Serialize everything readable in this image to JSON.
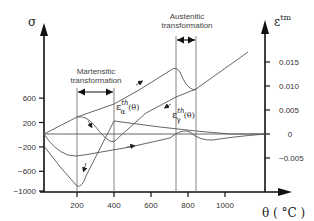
{
  "chart_data": {
    "type": "line",
    "title": "",
    "xlabel": "θ ( °C )",
    "ylabel_left": "σ",
    "ylabel_right": "ε^tm",
    "xlim": [
      0,
      1200
    ],
    "ylim_left": [
      -1000,
      1600
    ],
    "ylim_right": [
      -0.008,
      0.022
    ],
    "x_ticks": [
      200,
      400,
      600,
      800,
      1000
    ],
    "y_left_ticks": [
      600,
      200,
      -200,
      -600,
      -1000
    ],
    "y_right_ticks": [
      0.015,
      0.01,
      0.005,
      0,
      -0.005
    ],
    "y_right_tick_labels": [
      "0.015",
      "0.010",
      "0.005",
      "0",
      "-0.005"
    ],
    "grid": false,
    "annotations": [
      {
        "text": [
          "Martensitic",
          "transformation"
        ],
        "range_x": [
          200,
          400
        ]
      },
      {
        "text": [
          "Austenitic",
          "transformation"
        ],
        "range_x": [
          740,
          850
        ]
      },
      {
        "text": "ε_α^th(θ)",
        "near_x": 400
      },
      {
        "text": "ε_γ^th(θ)",
        "near_x": 760
      }
    ],
    "series": [
      {
        "name": "thermal strain heating/cooling loop (ε^tm)",
        "axis": "right",
        "x": [
          0,
          200,
          400,
          740,
          780,
          850,
          1150
        ],
        "y": [
          0.0,
          0.0035,
          0.0085,
          0.0145,
          0.012,
          0.0095,
          0.019
        ]
      },
      {
        "name": "ε_α^th(θ) cooling branch (ε^tm)",
        "axis": "right",
        "x": [
          200,
          290,
          400,
          600,
          750,
          850
        ],
        "y": [
          0.0035,
          0.0005,
          -0.002,
          0.002,
          0.0065,
          0.0095
        ]
      },
      {
        "name": "σ residual stress curve A",
        "axis": "left",
        "x": [
          0,
          100,
          200,
          280,
          400,
          600,
          800,
          1000,
          1150
        ],
        "y": [
          -200,
          -700,
          -920,
          -500,
          230,
          170,
          100,
          40,
          0
        ]
      },
      {
        "name": "σ residual stress curve B",
        "axis": "left",
        "x": [
          0,
          120,
          300,
          500,
          700,
          780,
          850,
          950,
          1150
        ],
        "y": [
          0,
          -330,
          -320,
          -260,
          -120,
          70,
          -40,
          -80,
          0
        ]
      },
      {
        "name": "zero reference",
        "axis": "left",
        "x": [
          0,
          1150
        ],
        "y": [
          0,
          0
        ]
      }
    ]
  },
  "labels": {
    "sigma": "σ",
    "epsilon_tm": "ε",
    "epsilon_tm_sup": "tm",
    "theta_axis": "θ ( °C )",
    "martensitic_1": "Martensitic",
    "martensitic_2": "transformation",
    "austenitic_1": "Austenitic",
    "austenitic_2": "transformation",
    "eps_alpha_base": "ε",
    "eps_alpha_sub": "α",
    "eps_alpha_sup": "th",
    "eps_alpha_arg": "(θ)",
    "eps_gamma_base": "ε",
    "eps_gamma_sub": "γ",
    "eps_gamma_sup": "th",
    "eps_gamma_arg": "(θ)"
  },
  "colors": {
    "axis": "#111111",
    "curve": "#555555",
    "guide": "#666666",
    "text": "#333333"
  }
}
